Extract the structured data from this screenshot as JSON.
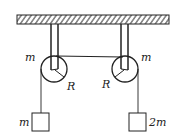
{
  "diagram": {
    "labels": {
      "left_pulley_mass": "m",
      "right_pulley_mass": "m",
      "left_pulley_radius": "R",
      "right_pulley_radius": "R",
      "left_block_mass": "m",
      "right_block_mass": "2m"
    },
    "colors": {
      "stroke": "#222222",
      "background": "#ffffff"
    }
  }
}
